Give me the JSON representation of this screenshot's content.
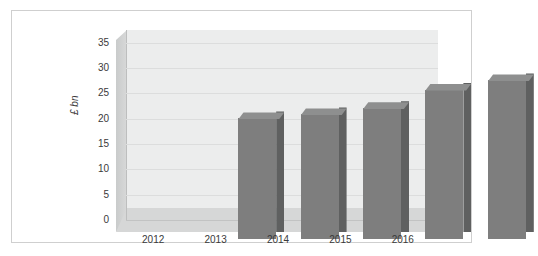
{
  "chart_data": {
    "type": "bar",
    "title": "",
    "subtitle": "",
    "xlabel": "",
    "ylabel": "£ bn",
    "categories": [
      "2012",
      "2013",
      "2014",
      "2015",
      "2016"
    ],
    "values": [
      23.8,
      24.6,
      25.8,
      29.5,
      31.3
    ],
    "series": [
      {
        "name": "",
        "values": [
          23.8,
          24.6,
          25.8,
          29.5,
          31.3
        ]
      }
    ],
    "ylim": [
      0,
      37.5
    ],
    "yticks": [
      "0",
      "5",
      "10",
      "15",
      "20",
      "25",
      "30",
      "35"
    ],
    "ytick_values": [
      0,
      5,
      10,
      15,
      20,
      25,
      30,
      35
    ],
    "grid": true,
    "legend": false,
    "legend_position": "none",
    "style": "3d-bar",
    "colors": {
      "bar_face": "#7e7e7e",
      "bar_side": "#5f6060",
      "bar_top": "#8e8f8f",
      "plot_background": "#eceded",
      "floor": "#d6d7d7",
      "sidewall": "#d0d1d1",
      "gridline": "#dcdddd",
      "axis_text": "#3a3a3a",
      "frame_border": "#cfcfcf",
      "page_background": "#ffffff"
    }
  }
}
